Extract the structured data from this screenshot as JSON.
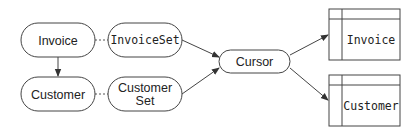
{
  "diagram": {
    "type": "data-flow",
    "nodes": {
      "invoice": {
        "label": "Invoice",
        "shape": "rounded",
        "font": "sans"
      },
      "invoice_set": {
        "label": "InvoiceSet",
        "shape": "rounded",
        "font": "mono"
      },
      "customer": {
        "label": "Customer",
        "shape": "rounded",
        "font": "sans"
      },
      "customer_set": {
        "line1": "Customer",
        "line2": "Set",
        "shape": "rounded",
        "font": "sans"
      },
      "cursor": {
        "label": "Cursor",
        "shape": "rounded",
        "font": "sans"
      },
      "invoice_table": {
        "label": "Invoice",
        "shape": "table",
        "font": "mono"
      },
      "customer_table": {
        "label": "Customer",
        "shape": "table",
        "font": "mono"
      }
    },
    "edges": [
      {
        "from": "Invoice",
        "to": "InvoiceSet",
        "style": "dashed"
      },
      {
        "from": "Customer",
        "to": "Customer Set",
        "style": "dashed"
      },
      {
        "from": "Invoice",
        "to": "Customer",
        "style": "arrow"
      },
      {
        "from": "InvoiceSet",
        "to": "Cursor",
        "style": "arrow"
      },
      {
        "from": "Customer Set",
        "to": "Cursor",
        "style": "arrow"
      },
      {
        "from": "Cursor",
        "to": "Invoice (table)",
        "style": "arrow"
      },
      {
        "from": "Cursor",
        "to": "Customer (table)",
        "style": "arrow"
      }
    ],
    "colors": {
      "stroke": "#444444",
      "text": "#222222",
      "background": "#ffffff"
    }
  }
}
